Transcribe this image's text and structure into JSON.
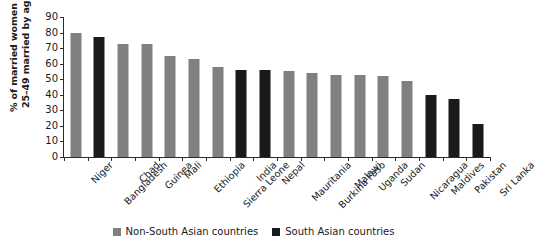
{
  "chart_data": {
    "type": "bar",
    "title": "",
    "xlabel": "",
    "ylabel": "% of married women aged\n25–49 married by age 18",
    "ylim": [
      0,
      90
    ],
    "yticks": [
      0,
      10,
      20,
      30,
      40,
      50,
      60,
      70,
      80,
      90
    ],
    "grid": false,
    "legend_position": "bottom",
    "categories": [
      "Niger",
      "Bangladesh",
      "Chad",
      "Guinea",
      "Mali",
      "Ethiopia",
      "Sierra Leone",
      "India",
      "Nepal",
      "Mauritania",
      "Burkina Faso",
      "Malawi",
      "Uganda",
      "Sudan",
      "Nicaragua",
      "Maldives",
      "Pakistan",
      "Sri Lanka"
    ],
    "values": [
      80,
      77,
      72.5,
      72.5,
      65,
      63,
      58,
      56,
      56,
      55,
      54,
      53,
      53,
      52,
      49,
      40,
      37,
      21
    ],
    "groups": [
      "non-south-asian",
      "south-asian",
      "non-south-asian",
      "non-south-asian",
      "non-south-asian",
      "non-south-asian",
      "non-south-asian",
      "south-asian",
      "south-asian",
      "non-south-asian",
      "non-south-asian",
      "non-south-asian",
      "non-south-asian",
      "non-south-asian",
      "non-south-asian",
      "south-asian",
      "south-asian",
      "south-asian"
    ],
    "series": [
      {
        "name": "Non-South Asian countries",
        "key": "non-south-asian",
        "color": "#808080"
      },
      {
        "name": "South Asian countries",
        "key": "south-asian",
        "color": "#1a1a1a"
      }
    ]
  },
  "legend": {
    "items": [
      {
        "label": "Non-South Asian countries",
        "color": "#808080"
      },
      {
        "label": "South Asian countries",
        "color": "#1a1a1a"
      }
    ]
  }
}
